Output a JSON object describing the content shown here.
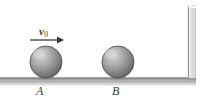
{
  "figure": {
    "type": "physics-diagram",
    "background_color": "#ffffff",
    "canvas": {
      "width": 213,
      "height": 109
    },
    "annotations": {
      "velocity_label_text": "v",
      "velocity_label_subscript": "0",
      "ball_a_label": "A",
      "ball_b_label": "B"
    },
    "colors": {
      "sphere_light": "#c9c9c9",
      "sphere_mid": "#949494",
      "sphere_dark": "#5f5f5f",
      "sphere_edge": "#4a4a4a",
      "ground_line": "#8f8f8f",
      "ground_shadow": "#cfcfcf",
      "wall_fill": "#e3e3e3",
      "wall_edge": "#8a8a8a",
      "arrow": "#3a3a3a",
      "label_text": "#3a3a3a"
    },
    "objects": {
      "ball_a": {
        "cx": 46,
        "cy": 62,
        "r": 16
      },
      "ball_b": {
        "cx": 118,
        "cy": 62,
        "r": 16
      },
      "ground": {
        "x1": 0,
        "x2": 196,
        "y": 78
      },
      "wall": {
        "x": 188,
        "y_top": 5,
        "y_bottom": 80,
        "thickness": 8
      },
      "arrow": {
        "x1": 30,
        "x2": 63,
        "y": 40
      }
    }
  }
}
